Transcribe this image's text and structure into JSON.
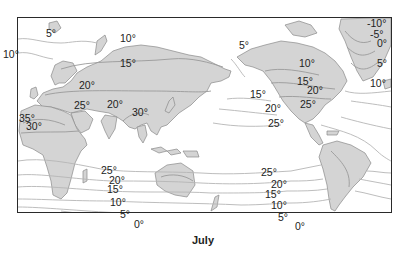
{
  "map": {
    "caption": "July",
    "subject": "Global mean surface temperature isotherms",
    "colors": {
      "land": "#d4d4d4",
      "land_outline": "#8a8a8a",
      "isotherm": "#b0b0b0",
      "land_isotherm": "#9a9a9a",
      "ocean": "#ffffff",
      "border": "#2a2a2a",
      "text": "#222222"
    },
    "labels": [
      {
        "text": "5°",
        "x": 46,
        "y": 28,
        "region": "north-atlantic-arctic"
      },
      {
        "text": "10°",
        "x": 3,
        "y": 49,
        "region": "north-atlantic"
      },
      {
        "text": "10°",
        "x": 120,
        "y": 33,
        "region": "siberia-north"
      },
      {
        "text": "15°",
        "x": 120,
        "y": 58,
        "region": "central-asia"
      },
      {
        "text": "20°",
        "x": 79,
        "y": 80,
        "region": "central-asia"
      },
      {
        "text": "25°",
        "x": 74,
        "y": 100,
        "region": "middle-east"
      },
      {
        "text": "20°",
        "x": 107,
        "y": 99,
        "region": "tibet"
      },
      {
        "text": "30°",
        "x": 132,
        "y": 107,
        "region": "southeast-asia"
      },
      {
        "text": "35°",
        "x": 19,
        "y": 113,
        "region": "sahara"
      },
      {
        "text": "30°",
        "x": 26,
        "y": 121,
        "region": "sahara"
      },
      {
        "text": "5°",
        "x": 239,
        "y": 40,
        "region": "bering"
      },
      {
        "text": "15°",
        "x": 250,
        "y": 89,
        "region": "north-pacific"
      },
      {
        "text": "20°",
        "x": 265,
        "y": 103,
        "region": "north-pacific"
      },
      {
        "text": "25°",
        "x": 268,
        "y": 118,
        "region": "north-pacific"
      },
      {
        "text": "10°",
        "x": 299,
        "y": 58,
        "region": "canada"
      },
      {
        "text": "15°",
        "x": 297,
        "y": 76,
        "region": "canada"
      },
      {
        "text": "20°",
        "x": 307,
        "y": 85,
        "region": "united-states"
      },
      {
        "text": "25°",
        "x": 300,
        "y": 99,
        "region": "united-states"
      },
      {
        "text": "-10°",
        "x": 367,
        "y": 18,
        "region": "greenland"
      },
      {
        "text": "-5°",
        "x": 370,
        "y": 29,
        "region": "greenland"
      },
      {
        "text": "0°",
        "x": 377,
        "y": 38,
        "region": "greenland"
      },
      {
        "text": "5°",
        "x": 377,
        "y": 58,
        "region": "greenland"
      },
      {
        "text": "10°",
        "x": 370,
        "y": 78,
        "region": "north-atlantic"
      },
      {
        "text": "25°",
        "x": 101,
        "y": 165,
        "region": "indian-ocean"
      },
      {
        "text": "20°",
        "x": 109,
        "y": 175,
        "region": "indian-ocean"
      },
      {
        "text": "15°",
        "x": 107,
        "y": 184,
        "region": "indian-ocean"
      },
      {
        "text": "10°",
        "x": 110,
        "y": 197,
        "region": "southern-indian-ocean"
      },
      {
        "text": "5°",
        "x": 120,
        "y": 209,
        "region": "southern-ocean"
      },
      {
        "text": "0°",
        "x": 134,
        "y": 219,
        "region": "southern-ocean"
      },
      {
        "text": "25°",
        "x": 261,
        "y": 167,
        "region": "south-pacific"
      },
      {
        "text": "20°",
        "x": 271,
        "y": 179,
        "region": "south-pacific"
      },
      {
        "text": "15°",
        "x": 265,
        "y": 189,
        "region": "south-pacific"
      },
      {
        "text": "10°",
        "x": 271,
        "y": 200,
        "region": "south-pacific"
      },
      {
        "text": "5°",
        "x": 278,
        "y": 212,
        "region": "southern-ocean"
      },
      {
        "text": "0°",
        "x": 295,
        "y": 221,
        "region": "southern-ocean"
      }
    ]
  }
}
